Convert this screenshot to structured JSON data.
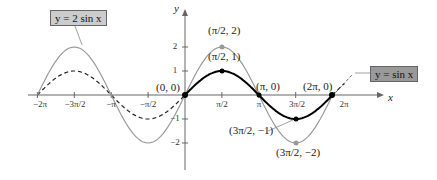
{
  "chart_data": {
    "type": "line",
    "title": "",
    "xlabel": "x",
    "ylabel": "y",
    "xlim": [
      -6.2832,
      6.2832
    ],
    "ylim": [
      -2.5,
      2.5
    ],
    "grid": false,
    "x_ticks": [
      "-2π",
      "-3π/2",
      "-π",
      "-π/2",
      "π/2",
      "π",
      "3π/2",
      "2π"
    ],
    "y_ticks": [
      "2",
      "1",
      "-1",
      "-2"
    ],
    "series": [
      {
        "name": "y = sin x",
        "expression": "sin(x)",
        "style": "solid black for 0..2π, dashed elsewhere",
        "color": "#000000",
        "key_points": [
          {
            "label": "(0, 0)",
            "x": 0,
            "y": 0
          },
          {
            "label": "(π/2, 1)",
            "x": 1.5708,
            "y": 1
          },
          {
            "label": "(π, 0)",
            "x": 3.1416,
            "y": 0
          },
          {
            "label": "(3π/2, -1)",
            "x": 4.7124,
            "y": -1
          },
          {
            "label": "(2π, 0)",
            "x": 6.2832,
            "y": 0
          }
        ]
      },
      {
        "name": "y = 2 sin x",
        "expression": "2*sin(x)",
        "style": "solid gray",
        "color": "#999999",
        "key_points": [
          {
            "label": "(π/2, 2)",
            "x": 1.5708,
            "y": 2
          },
          {
            "label": "(3π/2, -2)",
            "x": 4.7124,
            "y": -2
          }
        ]
      }
    ],
    "legend": [
      {
        "label": "y = 2 sin x",
        "position": "top-left"
      },
      {
        "label": "y = sin x",
        "position": "right"
      }
    ]
  },
  "labels": {
    "y_axis": "y",
    "x_axis": "x",
    "origin": "(0, 0)",
    "pi_half_2": "(π/2, 2)",
    "pi_half_1": "(π/2, 1)",
    "pi_0": "(π, 0)",
    "two_pi_0": "(2π, 0)",
    "three_pi_half_m1": "(3π/2, −1)",
    "three_pi_half_m2": "(3π/2, −2)",
    "legend_2sin": "y = 2 sin x",
    "legend_sin": "y = sin x"
  },
  "ticks": {
    "x": [
      "−2π",
      "−3π/2",
      "−π",
      "−π/2",
      "π/2",
      "π",
      "3π/2",
      "2π"
    ],
    "y": [
      "2",
      "1",
      "−1",
      "−2"
    ]
  }
}
